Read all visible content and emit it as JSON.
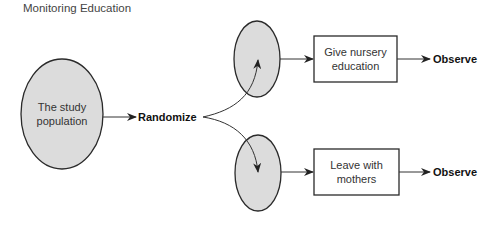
{
  "title": "Monitoring Education",
  "nodes": {
    "population": {
      "label_line1": "The study",
      "label_line2": "population"
    },
    "randomize": {
      "label": "Randomize"
    },
    "group_top_box": {
      "label_line1": "Give nursery",
      "label_line2": "education"
    },
    "group_bottom_box": {
      "label_line1": "Leave with",
      "label_line2": "mothers"
    },
    "observe_top": {
      "label": "Observe"
    },
    "observe_bottom": {
      "label": "Observe"
    }
  },
  "colors": {
    "fill": "#dcdcdc",
    "stroke": "#2a2a2a"
  }
}
